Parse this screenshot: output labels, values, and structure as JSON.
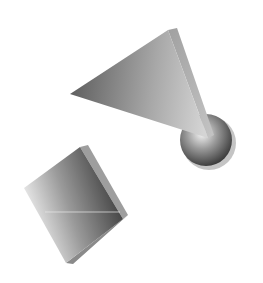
{
  "canvas": {
    "width": 263,
    "height": 283,
    "background": "#ffffff"
  },
  "shapes": [
    {
      "type": "triangle",
      "label": "3D gray triangle",
      "colors": {
        "light": "#d8d8d8",
        "dark": "#6a6a6a",
        "fin": "#b0b0b0"
      }
    },
    {
      "type": "sphere",
      "label": "3D gray sphere",
      "colors": {
        "highlight": "#f4f4f4",
        "mid": "#8c8c8c",
        "shadow": "#3c3c3c"
      }
    },
    {
      "type": "square",
      "label": "3D gray square tile",
      "colors": {
        "light": "#ffffff",
        "dark": "#3a3a3a",
        "edge": "#9a9a9a"
      }
    }
  ]
}
